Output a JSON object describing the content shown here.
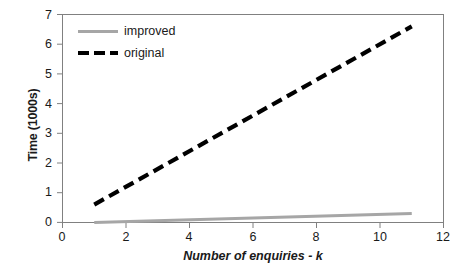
{
  "chart_data": {
    "type": "line",
    "title": "",
    "xlabel": "Number of enquiries - k",
    "ylabel": "Time (1000s)",
    "xlim": [
      0,
      12
    ],
    "ylim": [
      0,
      7
    ],
    "xticks": [
      0,
      2,
      4,
      6,
      8,
      10,
      12
    ],
    "yticks": [
      0,
      1,
      2,
      3,
      4,
      5,
      6,
      7
    ],
    "grid": false,
    "legend_position": "upper-left-inside",
    "x": [
      1,
      2,
      3,
      4,
      5,
      6,
      7,
      8,
      9,
      10,
      11
    ],
    "series": [
      {
        "name": "improved",
        "style": "solid",
        "color": "#a6a6a6",
        "values": [
          0.0,
          0.03,
          0.06,
          0.09,
          0.12,
          0.15,
          0.18,
          0.21,
          0.24,
          0.27,
          0.3
        ]
      },
      {
        "name": "original",
        "style": "dashed",
        "color": "#000000",
        "values": [
          0.6,
          1.2,
          1.8,
          2.4,
          3.0,
          3.6,
          4.2,
          4.8,
          5.4,
          6.0,
          6.6
        ]
      }
    ]
  },
  "axis": {
    "y_title": "Time (1000s)",
    "x_title": "Number of enquiries - k",
    "y_tick_labels": [
      "7",
      "6",
      "5",
      "4",
      "3",
      "2",
      "1",
      "0"
    ],
    "x_tick_labels": [
      "0",
      "2",
      "4",
      "6",
      "8",
      "10",
      "12"
    ]
  },
  "legend": {
    "items": [
      {
        "label": "improved"
      },
      {
        "label": "original"
      }
    ]
  },
  "colors": {
    "improved_line": "#a6a6a6",
    "original_line": "#000000",
    "frame": "#808080",
    "background": "#ffffff"
  }
}
